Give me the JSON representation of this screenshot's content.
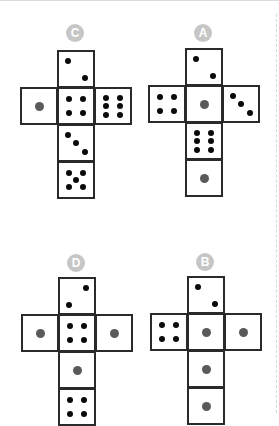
{
  "colors": {
    "border": "#2a2a2a",
    "pip": "#0a0a0a",
    "single_pip": "#5a5a5a",
    "label_bg": "#c6c6c6",
    "label_fg": "#ffffff"
  },
  "nets": [
    {
      "id": "C",
      "label": "C",
      "origin": [
        20,
        50
      ],
      "label_center": [
        75,
        33
      ],
      "faces": [
        {
          "col": 1,
          "row": 0,
          "value": 2,
          "pattern": "diag-tl-br"
        },
        {
          "col": 0,
          "row": 1,
          "value": 1
        },
        {
          "col": 1,
          "row": 1,
          "value": 4
        },
        {
          "col": 2,
          "row": 1,
          "value": 6,
          "pattern": "columns"
        },
        {
          "col": 1,
          "row": 2,
          "value": 3,
          "pattern": "diag-tl-br"
        },
        {
          "col": 1,
          "row": 3,
          "value": 5
        }
      ]
    },
    {
      "id": "A",
      "label": "A",
      "origin": [
        148,
        48
      ],
      "label_center": [
        203,
        33
      ],
      "faces": [
        {
          "col": 1,
          "row": 0,
          "value": 2,
          "pattern": "diag-tl-br"
        },
        {
          "col": 0,
          "row": 1,
          "value": 4
        },
        {
          "col": 1,
          "row": 1,
          "value": 1
        },
        {
          "col": 2,
          "row": 1,
          "value": 3,
          "pattern": "diag-tl-br"
        },
        {
          "col": 1,
          "row": 2,
          "value": 6,
          "pattern": "columns"
        },
        {
          "col": 1,
          "row": 3,
          "value": 1
        }
      ]
    },
    {
      "id": "D",
      "label": "D",
      "origin": [
        21,
        277
      ],
      "label_center": [
        76,
        263
      ],
      "faces": [
        {
          "col": 1,
          "row": 0,
          "value": 2,
          "pattern": "diag-tr-bl"
        },
        {
          "col": 0,
          "row": 1,
          "value": 1
        },
        {
          "col": 1,
          "row": 1,
          "value": 4
        },
        {
          "col": 2,
          "row": 1,
          "value": 1
        },
        {
          "col": 1,
          "row": 2,
          "value": 1
        },
        {
          "col": 1,
          "row": 3,
          "value": 4
        }
      ]
    },
    {
      "id": "B",
      "label": "B",
      "origin": [
        150,
        276
      ],
      "label_center": [
        205,
        262
      ],
      "faces": [
        {
          "col": 1,
          "row": 0,
          "value": 2,
          "pattern": "diag-tl-br"
        },
        {
          "col": 0,
          "row": 1,
          "value": 4
        },
        {
          "col": 1,
          "row": 1,
          "value": 1
        },
        {
          "col": 2,
          "row": 1,
          "value": 1
        },
        {
          "col": 1,
          "row": 2,
          "value": 1
        },
        {
          "col": 1,
          "row": 3,
          "value": 1
        }
      ]
    }
  ]
}
